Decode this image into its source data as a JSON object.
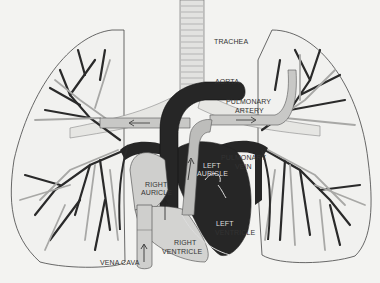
{
  "diagram": {
    "colors": {
      "background": "#f3f3f1",
      "outline": "#444444",
      "dark_vessel": "#2a2a2a",
      "gray_vessel": "#c8c8c6",
      "chamber_light": "#cfcfcd",
      "chamber_dark": "#262626"
    },
    "labels": {
      "trachea": "TRACHEA",
      "aorta": "AORTA",
      "pulmonary_artery_1": "PULMONARY",
      "pulmonary_artery_2": "ARTERY",
      "pulmonary_vein_1": "PULMONARY",
      "pulmonary_vein_2": "VEIN",
      "left_auricle_1": "LEFT",
      "left_auricle_2": "AURICLE",
      "right_auricle_1": "RIGHT",
      "right_auricle_2": "AURICLE",
      "left_ventricle_1": "LEFT",
      "left_ventricle_2": "VENTRICLE",
      "right_ventricle_1": "RIGHT",
      "right_ventricle_2": "VENTRICLE",
      "vena_cava": "VENA CAVA"
    }
  }
}
